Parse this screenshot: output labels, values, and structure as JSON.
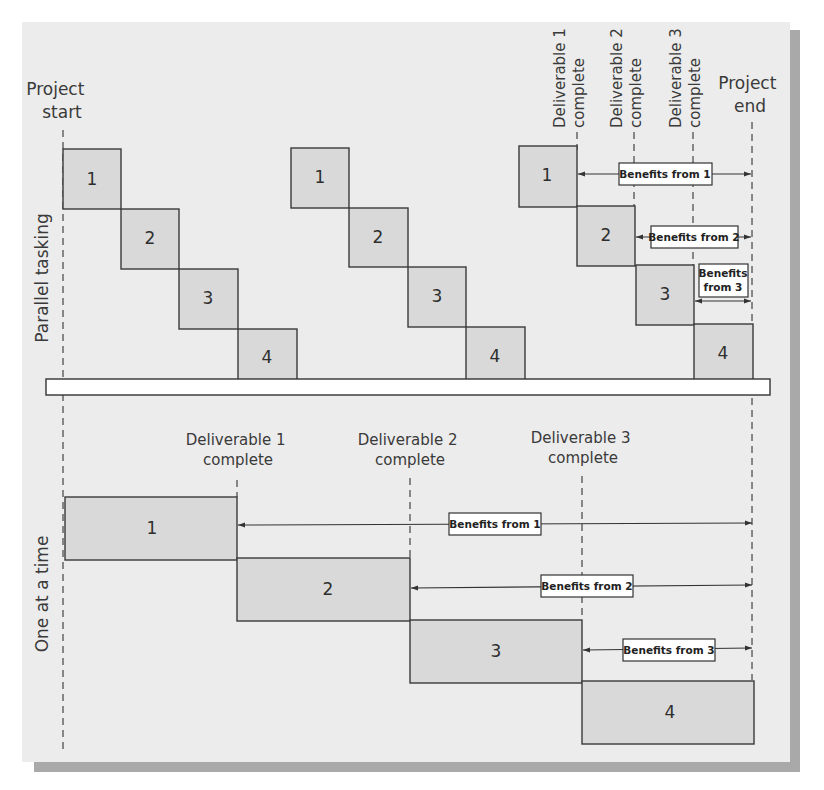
{
  "colors": {
    "background": "#ececec",
    "task_fill": "#d9d9d9",
    "task_stroke": "#3a3a3a",
    "shadow": "#a9a9a9",
    "divider_fill": "#ffffff"
  },
  "markers": {
    "project_start": "Project start",
    "project_end": "Project end",
    "project_start_l1": "Project",
    "project_start_l2": "start",
    "project_end_l1": "Project",
    "project_end_l2": "end"
  },
  "parallel": {
    "section_label": "Parallel tasking",
    "deliverables": [
      {
        "l1": "Deliverable 1",
        "l2": "complete"
      },
      {
        "l1": "Deliverable 2",
        "l2": "complete"
      },
      {
        "l1": "Deliverable 3",
        "l2": "complete"
      }
    ],
    "groups": [
      {
        "tasks": [
          "1",
          "2",
          "3",
          "4"
        ]
      },
      {
        "tasks": [
          "1",
          "2",
          "3",
          "4"
        ]
      },
      {
        "tasks": [
          "1",
          "2",
          "3",
          "4"
        ]
      }
    ],
    "benefits": [
      {
        "label": "Benefits from 1"
      },
      {
        "label": "Benefits from 2"
      },
      {
        "label_l1": "Benefits",
        "label_l2": "from 3"
      }
    ]
  },
  "sequential": {
    "section_label": "One at a time",
    "deliverables": [
      {
        "l1": "Deliverable 1",
        "l2": "complete"
      },
      {
        "l1": "Deliverable 2",
        "l2": "complete"
      },
      {
        "l1": "Deliverable 3",
        "l2": "complete"
      }
    ],
    "tasks": [
      "1",
      "2",
      "3",
      "4"
    ],
    "benefits": [
      {
        "label": "Benefits from 1"
      },
      {
        "label": "Benefits from 2"
      },
      {
        "label": "Benefits from 3"
      }
    ]
  }
}
